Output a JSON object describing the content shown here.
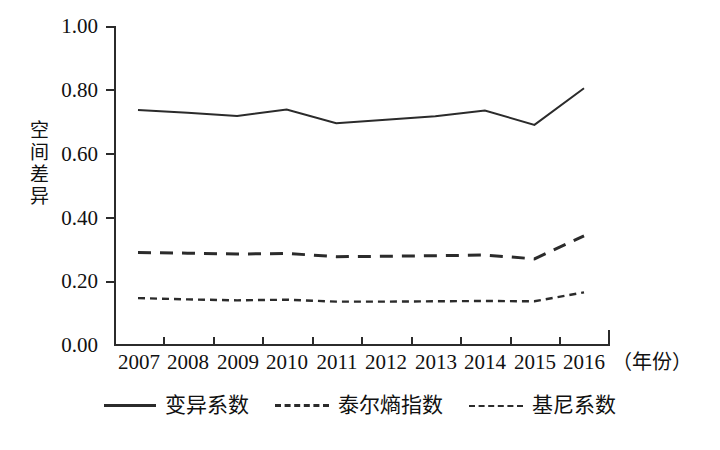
{
  "chart_data": {
    "type": "line",
    "title": "",
    "subtitle": "",
    "xlabel": "（年份）",
    "ylabel": "空间差异",
    "ylabel_chars": [
      "空",
      "间",
      "差",
      "异"
    ],
    "categories": [
      "2007",
      "2008",
      "2009",
      "2010",
      "2011",
      "2012",
      "2013",
      "2014",
      "2015",
      "2016"
    ],
    "x": [
      2007,
      2008,
      2009,
      2010,
      2011,
      2012,
      2013,
      2014,
      2015,
      2016
    ],
    "xlim": [
      2006.5,
      2016.5
    ],
    "ylim": [
      0.0,
      1.0
    ],
    "yticks": [
      0.0,
      0.2,
      0.4,
      0.6,
      0.8,
      1.0
    ],
    "ytick_labels": [
      "0.00",
      "0.20",
      "0.40",
      "0.60",
      "0.80",
      "1.00"
    ],
    "grid": false,
    "legend_position": "bottom",
    "series": [
      {
        "name": "变异系数",
        "style": "solid",
        "color": "#2b2b2b",
        "values": [
          0.737,
          0.728,
          0.718,
          0.738,
          0.695,
          0.706,
          0.717,
          0.735,
          0.69,
          0.805
        ]
      },
      {
        "name": "泰尔熵指数",
        "style": "dashed",
        "color": "#2b2b2b",
        "values": [
          0.29,
          0.288,
          0.285,
          0.287,
          0.277,
          0.278,
          0.28,
          0.282,
          0.27,
          0.342
        ]
      },
      {
        "name": "基尼系数",
        "style": "dotted",
        "color": "#2b2b2b",
        "values": [
          0.147,
          0.143,
          0.14,
          0.142,
          0.136,
          0.136,
          0.137,
          0.138,
          0.137,
          0.165
        ]
      }
    ]
  },
  "axes": {
    "y_title": "空间差异",
    "x_unit_label": "（年份）"
  },
  "legend": {
    "items": [
      {
        "label": "变异系数",
        "style": "solid"
      },
      {
        "label": "泰尔熵指数",
        "style": "dashed"
      },
      {
        "label": "基尼系数",
        "style": "dotted"
      }
    ]
  },
  "colors": {
    "ink": "#2b2b2b",
    "text": "#111111",
    "background": "#ffffff"
  }
}
